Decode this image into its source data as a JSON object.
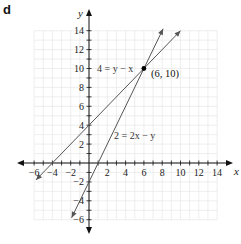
{
  "panel_label": "d",
  "chart_data": {
    "type": "line",
    "title": "",
    "xlabel": "x",
    "ylabel": "y",
    "xlim": [
      -6,
      14
    ],
    "ylim": [
      -6,
      14
    ],
    "grid": true,
    "x_ticks": [
      "-6",
      "-4",
      "-2",
      "2",
      "4",
      "6",
      "8",
      "10",
      "12",
      "14"
    ],
    "y_ticks": [
      "14",
      "12",
      "10",
      "8",
      "6",
      "4",
      "2",
      "-2",
      "-4",
      "-6"
    ],
    "series": [
      {
        "name": "4 = y − x",
        "equation": "y = x + 4",
        "x": [
          -5.8,
          10
        ],
        "y": [
          -1.8,
          14
        ]
      },
      {
        "name": "2 = 2x − y",
        "equation": "y = 2x − 2",
        "x": [
          -1.9,
          8.1
        ],
        "y": [
          -5.8,
          14.2
        ]
      }
    ],
    "annotations": [
      {
        "type": "point",
        "x": 6,
        "y": 10,
        "label": "(6, 10)"
      }
    ],
    "colors": {
      "lines": "#555555",
      "grid": "#e6e6e6",
      "axes": "#111111"
    }
  }
}
